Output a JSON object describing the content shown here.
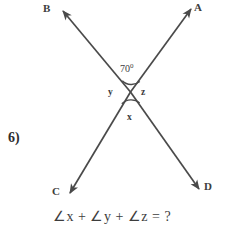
{
  "figure": {
    "type": "geometry-diagram",
    "problem_number": "6)",
    "vertex_labels": [
      {
        "name": "B",
        "text": "B",
        "position": "top-left"
      },
      {
        "name": "A",
        "text": "A",
        "position": "top-right"
      },
      {
        "name": "C",
        "text": "C",
        "position": "bottom-left"
      },
      {
        "name": "D",
        "text": "D",
        "position": "bottom-right"
      }
    ],
    "angles": [
      {
        "name": "known-angle",
        "text": "70",
        "degree_mark": "0",
        "full_text": "70°",
        "position": "top"
      },
      {
        "name": "angle-y",
        "text": "y",
        "position": "left"
      },
      {
        "name": "angle-z",
        "text": "z",
        "position": "right"
      },
      {
        "name": "angle-x",
        "text": "x",
        "position": "bottom"
      }
    ],
    "lines": [
      {
        "name": "line-CA",
        "from": "C",
        "to": "A",
        "arrows": "both"
      },
      {
        "name": "line-BD",
        "from": "B",
        "to": "D",
        "arrows": "both"
      }
    ],
    "equation": {
      "full": "∠x + ∠y + ∠z = ?",
      "parts": [
        "∠",
        "x",
        " + ",
        "∠",
        "y",
        " + ",
        "∠",
        "z",
        " = ?"
      ]
    },
    "colors": {
      "stroke": "#4a4a4a",
      "text": "#3d3d3d",
      "background": "#ffffff"
    }
  }
}
